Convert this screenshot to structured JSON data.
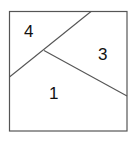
{
  "diagram": {
    "type": "partitioned-square",
    "frame": {
      "x": 9,
      "y": 11,
      "width": 118,
      "height": 120,
      "stroke": "#555555"
    },
    "lines": [
      {
        "name": "divider-a",
        "x1": 9,
        "y1": 77,
        "x2": 91,
        "y2": 11,
        "stroke": "#555555"
      },
      {
        "name": "divider-b",
        "x1": 44,
        "y1": 51,
        "x2": 127,
        "y2": 96,
        "stroke": "#555555"
      }
    ],
    "regions": [
      {
        "id": "region-4",
        "label": "4",
        "x": 24,
        "y": 23
      },
      {
        "id": "region-3",
        "label": "3",
        "x": 98,
        "y": 46
      },
      {
        "id": "region-1",
        "label": "1",
        "x": 49,
        "y": 85
      }
    ]
  }
}
